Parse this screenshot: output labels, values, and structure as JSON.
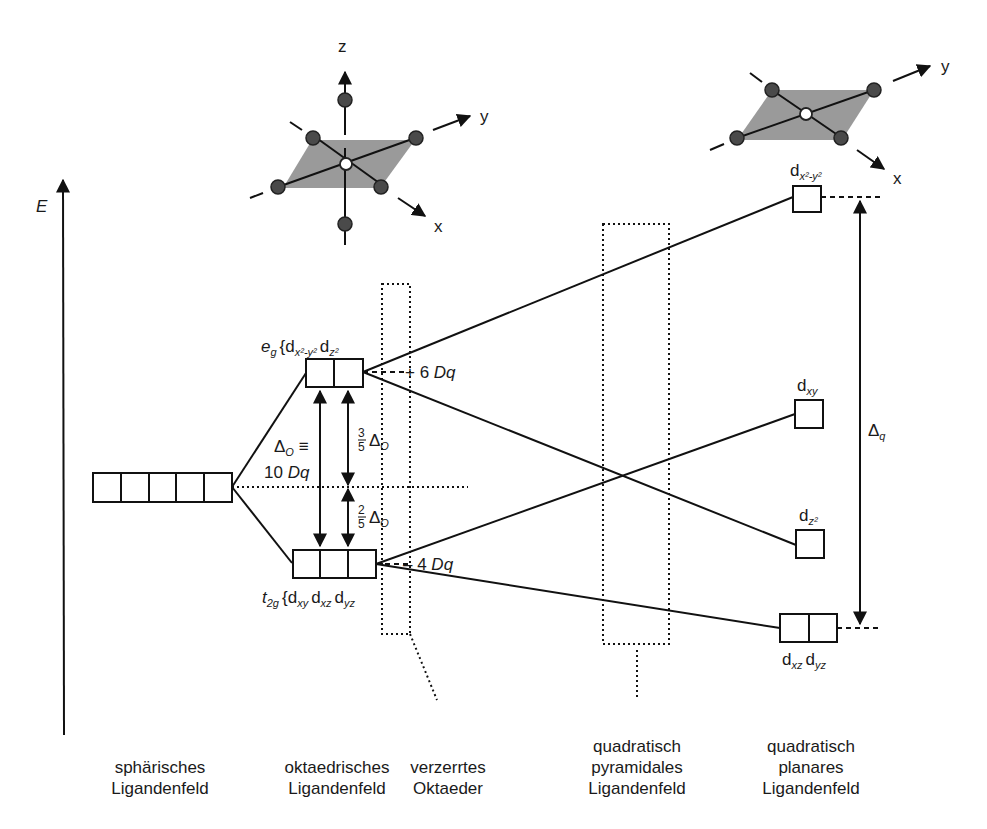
{
  "axis": {
    "energy_label": "E"
  },
  "molecules": {
    "octahedral": {
      "axes": {
        "z": "z",
        "y": "y",
        "x": "x"
      }
    },
    "square_planar": {
      "axes": {
        "y": "y",
        "x": "x"
      }
    }
  },
  "levels": {
    "spherical": {
      "boxes": 5
    },
    "eg": {
      "symbol": "e",
      "symbol_sub": "g",
      "brace": "{",
      "orbitals": [
        "d",
        "d"
      ],
      "orbital_subs": [
        "x²-y²",
        "z²"
      ],
      "energy": "+ 6 ",
      "energy_unit": "Dq"
    },
    "t2g": {
      "symbol": "t",
      "symbol_sub": "2g",
      "brace": "{",
      "orbitals": [
        "d",
        "d",
        "d"
      ],
      "orbital_subs": [
        "xy",
        "xz",
        "yz"
      ],
      "energy": "– 4 ",
      "energy_unit": "Dq"
    },
    "sq_dx2y2": {
      "label": "d",
      "sub": "x²-y²"
    },
    "sq_dxy": {
      "label": "d",
      "sub": "xy"
    },
    "sq_dz2": {
      "label": "d",
      "sub": "z²"
    },
    "sq_dxz_dyz": {
      "labels": [
        "d",
        "d"
      ],
      "subs": [
        "xz",
        "yz"
      ]
    }
  },
  "annotations": {
    "delta_o": {
      "symbol": "Δ",
      "sub": "O",
      "equiv": " ≡",
      "line2_num": "10 ",
      "line2_unit": "Dq"
    },
    "three_fifths": {
      "num": "3",
      "den": "5",
      "symbol": "Δ",
      "sub": "O"
    },
    "two_fifths": {
      "num": "2",
      "den": "5",
      "symbol": "Δ",
      "sub": "O"
    },
    "delta_q": {
      "symbol": "Δ",
      "sub": "q"
    }
  },
  "columns": [
    {
      "id": "spherical",
      "lines": [
        "sphärisches",
        "Ligandenfeld"
      ]
    },
    {
      "id": "octahedral",
      "lines": [
        "oktaedrisches",
        "Ligandenfeld"
      ]
    },
    {
      "id": "distorted",
      "lines": [
        "verzerrtes",
        "Oktaeder"
      ]
    },
    {
      "id": "square-pyramidal",
      "lines": [
        "quadratisch",
        "pyramidales",
        "Ligandenfeld"
      ]
    },
    {
      "id": "square-planar",
      "lines": [
        "quadratisch",
        "planares",
        "Ligandenfeld"
      ]
    }
  ]
}
